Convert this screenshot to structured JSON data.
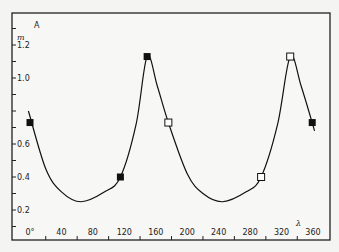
{
  "chart_data": {
    "type": "line",
    "title": "A",
    "xlabel": "λ",
    "ylabel": "m",
    "xlim": [
      -5,
      375
    ],
    "ylim": [
      0.1,
      1.3
    ],
    "grid": false,
    "legend": null,
    "x_ticks": [
      "0°",
      "40",
      "80",
      "120",
      "160",
      "200",
      "240",
      "280",
      "320",
      "360"
    ],
    "y_ticks": [
      "0.2",
      "0.4",
      "0.6",
      "1.0",
      "1.2"
    ],
    "series": [
      {
        "name": "filled squares",
        "marker": "filled-square",
        "points": [
          {
            "x": 0,
            "y": 0.73
          },
          {
            "x": 115,
            "y": 0.4
          },
          {
            "x": 149,
            "y": 1.13
          },
          {
            "x": 359,
            "y": 0.73
          }
        ]
      },
      {
        "name": "open squares",
        "marker": "open-square",
        "points": [
          {
            "x": 176,
            "y": 0.73
          },
          {
            "x": 294,
            "y": 0.4
          },
          {
            "x": 331,
            "y": 1.13
          }
        ]
      },
      {
        "name": "fitted curve",
        "marker": "none",
        "points": [
          {
            "x": -2,
            "y": 0.8
          },
          {
            "x": 20,
            "y": 0.45
          },
          {
            "x": 40,
            "y": 0.31
          },
          {
            "x": 65,
            "y": 0.25
          },
          {
            "x": 95,
            "y": 0.31
          },
          {
            "x": 115,
            "y": 0.4
          },
          {
            "x": 135,
            "y": 0.72
          },
          {
            "x": 149,
            "y": 1.13
          },
          {
            "x": 162,
            "y": 0.95
          },
          {
            "x": 176,
            "y": 0.73
          },
          {
            "x": 200,
            "y": 0.42
          },
          {
            "x": 220,
            "y": 0.3
          },
          {
            "x": 245,
            "y": 0.25
          },
          {
            "x": 275,
            "y": 0.31
          },
          {
            "x": 294,
            "y": 0.4
          },
          {
            "x": 315,
            "y": 0.72
          },
          {
            "x": 331,
            "y": 1.13
          },
          {
            "x": 345,
            "y": 0.95
          },
          {
            "x": 362,
            "y": 0.68
          }
        ]
      }
    ]
  }
}
